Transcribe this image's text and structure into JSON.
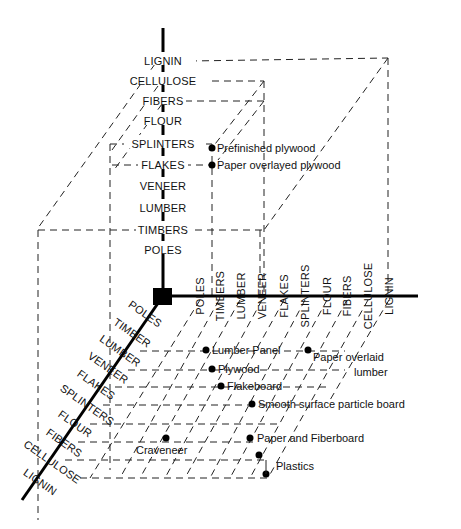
{
  "diagram": {
    "title": "",
    "colors": {
      "ink": "#000000",
      "background": "#ffffff"
    },
    "vertical_axis": {
      "labels": [
        "LIGNIN",
        "CELLULOSE",
        "FIBERS",
        "FLOUR",
        "SPLINTERS",
        "FLAKES",
        "VENEER",
        "LUMBER",
        "TIMBERS",
        "POLES"
      ]
    },
    "horizontal_axis": {
      "labels": [
        "POLES",
        "TIMBERS",
        "LUMBER",
        "VENEER",
        "FLAKES",
        "SPLINTERS",
        "FLOUR",
        "FIBERS",
        "CELLULOSE",
        "LIGNIN"
      ]
    },
    "diagonal_axis": {
      "labels": [
        "POLES",
        "TIMBER",
        "LUMBER",
        "VENEER",
        "FLAKES",
        "SPLINTERS",
        "FLOUR",
        "FIBERS",
        "CELLULOSE",
        "LIGNIN"
      ]
    },
    "products": [
      {
        "label": "Prefinished plywood"
      },
      {
        "label": "Paper overlayed plywood"
      },
      {
        "label": "Lumber Panel"
      },
      {
        "label": "Paper overlaid"
      },
      {
        "label": "lumber"
      },
      {
        "label": "Plywood"
      },
      {
        "label": "Flakeboard"
      },
      {
        "label": "Smooth surface particle board"
      },
      {
        "label": "Paper and Fiberboard"
      },
      {
        "label": "Craveneer"
      },
      {
        "label": "Plastics"
      }
    ]
  }
}
